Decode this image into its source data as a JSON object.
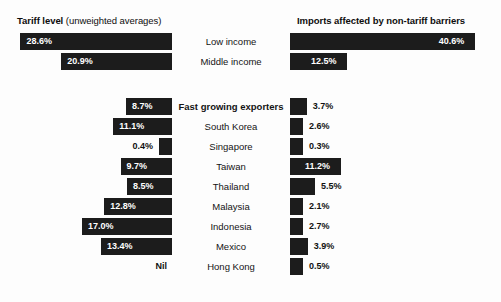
{
  "headers": {
    "left_bold": "Tariff level",
    "left_regular": " (unweighted averages)",
    "right": "Imports affected by non-tariff barriers"
  },
  "nil_text": "Nil",
  "chart_data": {
    "type": "bar",
    "orientation": "horizontal",
    "layout": "back-to-back bidirectional bars with centered category labels",
    "xlabel": "",
    "ylabel": "",
    "grid": false,
    "legend": "none",
    "series": [
      {
        "name": "Tariff level (unweighted averages)",
        "side": "left",
        "unit": "%"
      },
      {
        "name": "Imports affected by non-tariff barriers",
        "side": "right",
        "unit": "%"
      }
    ],
    "groups": [
      {
        "name": "income-groups",
        "rows": [
          {
            "category": "Low income",
            "bold": false,
            "tariff_level": 28.6,
            "tariff_label": "28.6%",
            "ntb": 40.6,
            "ntb_label": "40.6%"
          },
          {
            "category": "Middle income",
            "bold": false,
            "tariff_level": 20.9,
            "tariff_label": "20.9%",
            "ntb": 12.5,
            "ntb_label": "12.5%"
          }
        ]
      },
      {
        "name": "fast-growing-exporters",
        "rows": [
          {
            "category": "Fast growing exporters",
            "bold": true,
            "tariff_level": 8.7,
            "tariff_label": "8.7%",
            "ntb": 3.7,
            "ntb_label": "3.7%"
          },
          {
            "category": "South Korea",
            "bold": false,
            "tariff_level": 11.1,
            "tariff_label": "11.1%",
            "ntb": 2.6,
            "ntb_label": "2.6%"
          },
          {
            "category": "Singapore",
            "bold": false,
            "tariff_level": 0.4,
            "tariff_label": "0.4%",
            "ntb": 0.3,
            "ntb_label": "0.3%"
          },
          {
            "category": "Taiwan",
            "bold": false,
            "tariff_level": 9.7,
            "tariff_label": "9.7%",
            "ntb": 11.2,
            "ntb_label": "11.2%"
          },
          {
            "category": "Thailand",
            "bold": false,
            "tariff_level": 8.5,
            "tariff_label": "8.5%",
            "ntb": 5.5,
            "ntb_label": "5.5%"
          },
          {
            "category": "Malaysia",
            "bold": false,
            "tariff_level": 12.8,
            "tariff_label": "12.8%",
            "ntb": 2.1,
            "ntb_label": "2.1%"
          },
          {
            "category": "Indonesia",
            "bold": false,
            "tariff_level": 17.0,
            "tariff_label": "17.0%",
            "ntb": 2.7,
            "ntb_label": "2.7%"
          },
          {
            "category": "Mexico",
            "bold": false,
            "tariff_level": 13.4,
            "tariff_label": "13.4%",
            "ntb": 3.9,
            "ntb_label": "3.9%"
          },
          {
            "category": "Hong Kong",
            "bold": false,
            "tariff_level": 0,
            "tariff_label": "Nil",
            "ntb": 0.5,
            "ntb_label": "0.5%"
          }
        ]
      }
    ]
  },
  "colors": {
    "bar": "#1c1c1c",
    "background": "#fdfdfd",
    "text": "#111111",
    "bar_text": "#ffffff"
  }
}
